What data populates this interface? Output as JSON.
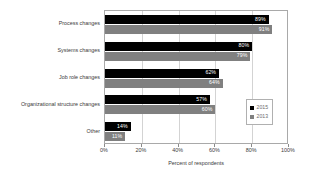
{
  "chart_data": {
    "type": "bar",
    "orientation": "horizontal",
    "title": "",
    "xlabel": "Percent of respondents",
    "ylabel": "",
    "xlim": [
      0,
      100
    ],
    "xticks": [
      "0%",
      "20%",
      "40%",
      "60%",
      "80%",
      "100%"
    ],
    "xtick_values": [
      0,
      20,
      40,
      60,
      80,
      100
    ],
    "grid": true,
    "grid_axis": "x",
    "legend_position": "right-center",
    "categories": [
      "Process changes",
      "Systems changes",
      "Job role changes",
      "Organizational structure changes",
      "Other"
    ],
    "series": [
      {
        "name": "2015",
        "color": "#000000",
        "values": [
          89,
          80,
          62,
          57,
          14
        ],
        "labels": [
          "89%",
          "80%",
          "62%",
          "57%",
          "14%"
        ]
      },
      {
        "name": "2013",
        "color": "#808080",
        "values": [
          91,
          79,
          64,
          60,
          11
        ],
        "labels": [
          "91%",
          "79%",
          "64%",
          "60%",
          "11%"
        ]
      }
    ]
  },
  "legend": {
    "entries": [
      {
        "label": "2015",
        "color": "#000000"
      },
      {
        "label": "2013",
        "color": "#808080"
      }
    ]
  }
}
